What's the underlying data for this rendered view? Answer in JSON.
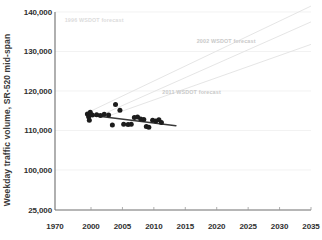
{
  "chart_data": {
    "type": "scatter",
    "title": "",
    "subtitle": "",
    "xlabel": "",
    "ylabel": "Weekday traffic volume, SR-520 mid-span",
    "grid": true,
    "legend_position": "inline-annotations",
    "xlim": [
      1970,
      2035
    ],
    "ylim": [
      25000,
      140000
    ],
    "ytick_labels": [
      "140,000",
      "130,000",
      "120,000",
      "110,000",
      "100,000",
      "25,000"
    ],
    "ytick_values": [
      140000,
      130000,
      120000,
      110000,
      100000,
      25000
    ],
    "xtick_labels": [
      "1970",
      "2000",
      "2005",
      "2010",
      "2015",
      "2020",
      "2025",
      "2030",
      "2035"
    ],
    "xtick_values": [
      1970,
      2000,
      2005,
      2010,
      2015,
      2020,
      2025,
      2030,
      2035
    ],
    "series": [
      {
        "name": "Observed weekday traffic volume",
        "type": "scatter",
        "color": "#1c1c1c",
        "points": [
          {
            "x": 1997.0,
            "y": 114200
          },
          {
            "x": 1998.0,
            "y": 113500
          },
          {
            "x": 1998.6,
            "y": 112600
          },
          {
            "x": 1999.4,
            "y": 114600
          },
          {
            "x": 2000.2,
            "y": 113900
          },
          {
            "x": 2000.9,
            "y": 114000
          },
          {
            "x": 2001.5,
            "y": 113800
          },
          {
            "x": 2002.1,
            "y": 114100
          },
          {
            "x": 2002.8,
            "y": 113900
          },
          {
            "x": 2003.4,
            "y": 111400
          },
          {
            "x": 2003.9,
            "y": 116600
          },
          {
            "x": 2004.6,
            "y": 115100
          },
          {
            "x": 2005.2,
            "y": 111600
          },
          {
            "x": 2005.9,
            "y": 111500
          },
          {
            "x": 2006.4,
            "y": 111600
          },
          {
            "x": 2006.9,
            "y": 113300
          },
          {
            "x": 2007.4,
            "y": 113400
          },
          {
            "x": 2007.9,
            "y": 112900
          },
          {
            "x": 2008.4,
            "y": 112800
          },
          {
            "x": 2008.8,
            "y": 111000
          },
          {
            "x": 2009.2,
            "y": 110800
          },
          {
            "x": 2009.8,
            "y": 112600
          },
          {
            "x": 2010.3,
            "y": 112400
          },
          {
            "x": 2010.8,
            "y": 112700
          },
          {
            "x": 2011.2,
            "y": 112000
          }
        ]
      },
      {
        "name": "Observed trend line",
        "type": "line",
        "color": "#3a3a3a",
        "points": [
          {
            "x": 1996.6,
            "y": 114000
          },
          {
            "x": 2013.5,
            "y": 111200
          }
        ]
      },
      {
        "name": "1996 WSDOT forecast",
        "type": "line",
        "color": "#e2e2e2",
        "label": "1996 WSDOT forecast",
        "label_x": 2000.5,
        "label_y": 137500,
        "points": [
          {
            "x": 1997.0,
            "y": 114500
          },
          {
            "x": 2035.0,
            "y": 141500
          }
        ]
      },
      {
        "name": "2002 WSDOT forecast",
        "type": "line",
        "color": "#e2e2e2",
        "label": "2002 WSDOT forecast",
        "label_x": 2021.5,
        "label_y": 132200,
        "points": [
          {
            "x": 2002.0,
            "y": 114200
          },
          {
            "x": 2035.0,
            "y": 137500
          }
        ]
      },
      {
        "name": "2011 WSDOT forecast",
        "type": "line",
        "color": "#e2e2e2",
        "label": "2011 WSDOT forecast",
        "label_x": 2016.0,
        "label_y": 119200,
        "points": [
          {
            "x": 2003.0,
            "y": 113800
          },
          {
            "x": 2035.0,
            "y": 131800
          }
        ]
      }
    ]
  },
  "axis": {
    "y_title": "Weekday traffic volume, SR-520 mid-span"
  },
  "colors": {
    "background": "#ffffff",
    "axis": "#6e6e6e",
    "grid": "#ededed",
    "data": "#1c1c1c",
    "trend": "#3a3a3a",
    "forecast": "#e2e2e2",
    "tick_text": "#2f2f2f"
  }
}
